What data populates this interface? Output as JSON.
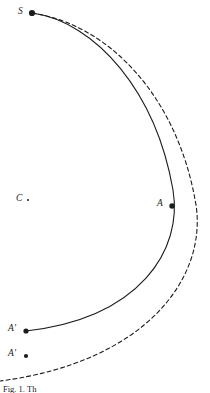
{
  "figure": {
    "caption": "Fig. 1. Th",
    "background_color": "#ffffff",
    "stroke_color": "#1c1c1c",
    "width": 210,
    "height": 393,
    "points": [
      {
        "id": "S",
        "label": "S",
        "x": 32,
        "y": 13,
        "dot_radius": 3.1,
        "label_x": 18,
        "label_y": 7
      },
      {
        "id": "C",
        "label": "C",
        "x": 28,
        "y": 200,
        "dot_radius": 1.0,
        "label_x": 16,
        "label_y": 194
      },
      {
        "id": "A",
        "label": "A",
        "x": 172,
        "y": 206,
        "dot_radius": 2.7,
        "label_x": 157,
        "label_y": 199
      },
      {
        "id": "Ap",
        "label": "A′",
        "x": 26,
        "y": 331,
        "dot_radius": 2.6,
        "label_x": 8,
        "label_y": 324
      },
      {
        "id": "App",
        "label": "A′",
        "x": 26,
        "y": 356,
        "dot_radius": 2.1,
        "label_x": 8,
        "label_y": 349
      }
    ],
    "curves": [
      {
        "id": "solid-arc",
        "style": "solid",
        "stroke_width": 1.1,
        "path": "M 32 13 C 96 22 156 92 173 190 C 183 250 140 318 26 331"
      },
      {
        "id": "dashed-arc",
        "style": "dashed",
        "stroke_width": 1.1,
        "dash": "4 3",
        "path": "M 32 13 C 108 24 178 96 196 205 C 207 278 146 362 0 381"
      }
    ]
  }
}
